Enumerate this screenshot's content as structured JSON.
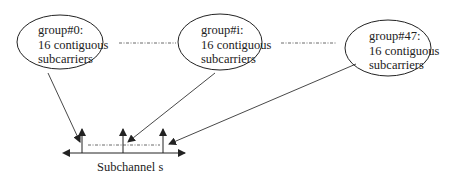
{
  "diagram": {
    "groups": [
      {
        "id": "group-0",
        "line1": "group#0:",
        "line2": "16 contiguous",
        "line3": "subcarriers"
      },
      {
        "id": "group-i",
        "line1": "group#i:",
        "line2": "16 contiguous",
        "line3": "subcarriers"
      },
      {
        "id": "group-47",
        "line1": "group#47:",
        "line2": "16 contiguous",
        "line3": "subcarriers"
      }
    ],
    "axis_label": "Subchannel s",
    "colors": {
      "stroke": "#222222",
      "background": "#ffffff"
    }
  }
}
